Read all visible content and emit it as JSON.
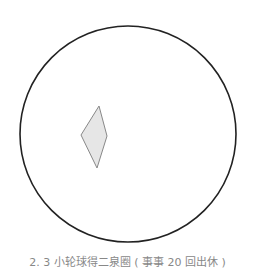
{
  "figure": {
    "circle": {
      "cx": 128,
      "cy": 134,
      "r": 108,
      "stroke": "#222222",
      "stroke_width": 1.6,
      "fill": "none"
    },
    "diamond": {
      "points": "99,106 107,136 97,168 81,135",
      "stroke": "#888888",
      "stroke_width": 1,
      "fill": "#e6e6e6"
    }
  },
  "caption": "2. 3 小轮球得二泉圈 ( 事事 20 回出休 )"
}
